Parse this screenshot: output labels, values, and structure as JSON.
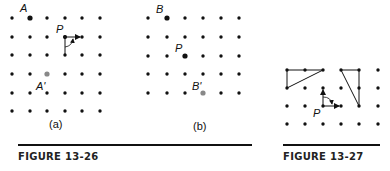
{
  "figure_13_26": {
    "caption": "FIGURE 13-26",
    "panel_a": {
      "label": "(a)",
      "grid": {
        "cols": 6,
        "rows": 6
      },
      "points": {
        "A": "A",
        "P": "P",
        "A_prime": "A'"
      }
    },
    "panel_b": {
      "label": "(b)",
      "grid": {
        "cols": 6,
        "rows": 5
      },
      "points": {
        "B": "B",
        "P": "P",
        "B_prime": "B'"
      }
    }
  },
  "figure_13_27": {
    "caption": "FIGURE 13-27",
    "grid": {
      "cols": 6,
      "rows": 4
    },
    "points": {
      "P": "P"
    }
  },
  "colors": {
    "dot": "#111111",
    "image_point": "#888888",
    "line": "#111111"
  }
}
